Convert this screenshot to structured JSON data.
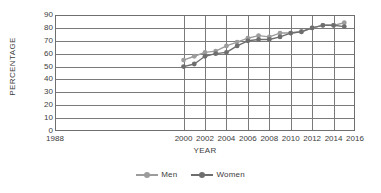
{
  "chart_data": {
    "type": "line",
    "title": "",
    "xlabel": "YEAR",
    "ylabel": "PERCENTAGE",
    "xlim": [
      1988,
      2016
    ],
    "ylim": [
      0,
      90
    ],
    "xticks": [
      1988,
      2000,
      2002,
      2004,
      2006,
      2008,
      2010,
      2012,
      2014,
      2016
    ],
    "yticks": [
      0,
      10,
      20,
      30,
      40,
      50,
      60,
      70,
      80,
      90
    ],
    "grid": "horizontal-and-vertical",
    "legend_position": "bottom-center",
    "x": [
      2000,
      2001,
      2002,
      2003,
      2004,
      2005,
      2006,
      2007,
      2008,
      2009,
      2010,
      2011,
      2012,
      2013,
      2014,
      2015
    ],
    "series": [
      {
        "name": "Men",
        "color": "#9c9c9c",
        "values": [
          55,
          58,
          61,
          62,
          66,
          69,
          72,
          74,
          73,
          76,
          76,
          77,
          80,
          82,
          82,
          84
        ]
      },
      {
        "name": "Women",
        "color": "#6e6e6e",
        "values": [
          50,
          52,
          58,
          60,
          61,
          66,
          70,
          71,
          71,
          73,
          76,
          77,
          80,
          82,
          82,
          81
        ]
      }
    ]
  },
  "axes": {
    "y_title": "PERCENTAGE",
    "x_title": "YEAR"
  },
  "colors": {
    "men": "#9c9c9c",
    "women": "#6e6e6e",
    "grid": "#7a7a7a",
    "text": "#3d3d3d",
    "background": "#ffffff"
  }
}
